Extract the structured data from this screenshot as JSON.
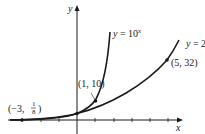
{
  "figure": {
    "axes": {
      "x_label": "x",
      "y_label": "y"
    },
    "curves": [
      {
        "id": "ten-power",
        "label_lhs": "y = 10",
        "label_exp": "x"
      },
      {
        "id": "two-power",
        "label_lhs": "y = 2",
        "label_exp": "x"
      }
    ],
    "points": [
      {
        "id": "p1",
        "label": "(1, 10)"
      },
      {
        "id": "p2",
        "label": "(5, 32)"
      },
      {
        "id": "p3",
        "label_prefix": "(−3,",
        "label_num": "1",
        "label_den": "8",
        "label_suffix": ")"
      }
    ],
    "colors": {
      "stroke": "#1a1a1a",
      "background": "#ffffff"
    }
  }
}
